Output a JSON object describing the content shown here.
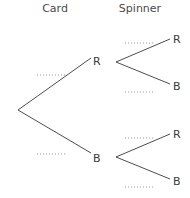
{
  "headers": {
    "card": "Card",
    "spinner": "Spinner"
  },
  "tree": {
    "card_outcomes": [
      {
        "label": "R",
        "probability_blank": "........"
      },
      {
        "label": "B",
        "probability_blank": "........"
      }
    ],
    "spinner_outcomes": {
      "after_R": [
        {
          "label": "R",
          "probability_blank": "........"
        },
        {
          "label": "B",
          "probability_blank": "........"
        }
      ],
      "after_B": [
        {
          "label": "R",
          "probability_blank": "........"
        },
        {
          "label": "B",
          "probability_blank": "........"
        }
      ]
    }
  },
  "colors": {
    "branch": "#4d4d4d",
    "dots": "#9a9a9a",
    "text": "#3a3a3a"
  }
}
